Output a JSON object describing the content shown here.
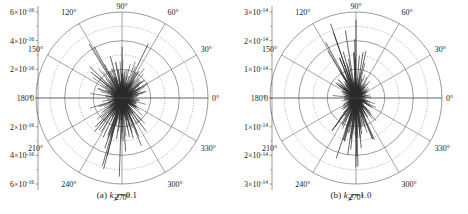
{
  "figure": {
    "panels": [
      {
        "id": "a",
        "caption_prefix": "(a) ",
        "caption_symbol": "k",
        "caption_sub": "3",
        "caption_var": "r",
        "caption_value": "=0.1",
        "caption_full": "(a) k3r=0.1"
      },
      {
        "id": "b",
        "caption_prefix": "(b) ",
        "caption_symbol": "k",
        "caption_sub": "3",
        "caption_var": "r",
        "caption_value": "=1.0",
        "caption_full": "(b) k3r=1.0"
      }
    ]
  },
  "chart_data": [
    {
      "type": "line",
      "plot_style": "polar-spike",
      "title": "(a) k3r=0.1",
      "xlabel": "",
      "ylabel": "",
      "grid": true,
      "legend": null,
      "angle_unit": "degrees",
      "angle_ticks": [
        "0°",
        "30°",
        "60°",
        "90°",
        "120°",
        "150°",
        "180°",
        "210°",
        "240°",
        "270°",
        "300°",
        "330°"
      ],
      "radial_axis": {
        "labels_top_to_bottom": [
          "6×10-16",
          "4×10-16",
          "2×10-16",
          "0",
          "2×10-16",
          "4×10-16",
          "6×10-16"
        ],
        "mantissas": [
          6,
          4,
          2,
          0,
          2,
          4,
          6
        ],
        "exponent": "-16",
        "rmax": 6e-16,
        "solid_rings": [
          2e-16,
          4e-16,
          6e-16
        ],
        "dotted_rings": [
          1e-16,
          3e-16,
          5e-16
        ]
      },
      "series": [
        {
          "name": "scattering amplitude",
          "theta_deg": [
            0,
            4,
            7,
            11,
            15,
            19,
            23,
            26,
            30,
            34,
            38,
            41,
            45,
            49,
            53,
            56,
            60,
            64,
            68,
            71,
            75,
            79,
            83,
            86,
            90,
            94,
            98,
            101,
            105,
            109,
            113,
            116,
            120,
            124,
            128,
            131,
            135,
            139,
            143,
            146,
            150,
            154,
            158,
            161,
            165,
            169,
            173,
            176,
            180,
            184,
            188,
            191,
            195,
            199,
            203,
            206,
            210,
            214,
            218,
            221,
            225,
            229,
            233,
            236,
            240,
            244,
            248,
            251,
            255,
            259,
            263,
            266,
            270,
            274,
            278,
            281,
            285,
            289,
            293,
            296,
            300,
            304,
            308,
            311,
            315,
            319,
            323,
            326,
            330,
            334,
            338,
            341,
            345,
            349,
            353,
            356
          ],
          "values": [
            0.9,
            1.4,
            0.7,
            1.9,
            1.1,
            2.2,
            0.8,
            1.5,
            2.6,
            1.0,
            1.7,
            0.9,
            2.1,
            1.3,
            2.8,
            1.2,
            1.8,
            3.0,
            1.5,
            2.4,
            1.1,
            3.4,
            1.9,
            2.7,
            4.4,
            2.0,
            3.1,
            1.6,
            2.9,
            3.8,
            1.8,
            2.3,
            3.3,
            1.4,
            2.0,
            0.9,
            1.6,
            2.5,
            1.2,
            1.8,
            1.0,
            2.1,
            1.3,
            0.8,
            1.5,
            0.9,
            1.7,
            1.1,
            0.6,
            1.2,
            0.8,
            1.4,
            1.0,
            1.9,
            1.3,
            0.9,
            1.6,
            1.1,
            2.0,
            1.4,
            2.3,
            1.6,
            2.9,
            1.8,
            2.4,
            3.5,
            2.0,
            3.0,
            4.1,
            2.6,
            3.3,
            2.1,
            4.6,
            2.8,
            3.9,
            2.2,
            3.1,
            1.9,
            2.7,
            1.5,
            2.2,
            1.3,
            2.6,
            1.7,
            1.1,
            2.0,
            1.4,
            0.9,
            1.6,
            1.2,
            2.1,
            1.0,
            1.5,
            0.8,
            1.3,
            1.1
          ],
          "value_scale": 1e-16
        }
      ]
    },
    {
      "type": "line",
      "plot_style": "polar-spike",
      "title": "(b) k3r=1.0",
      "xlabel": "",
      "ylabel": "",
      "grid": true,
      "legend": null,
      "angle_unit": "degrees",
      "angle_ticks": [
        "0°",
        "30°",
        "60°",
        "90°",
        "120°",
        "150°",
        "180°",
        "210°",
        "240°",
        "270°",
        "300°",
        "330°"
      ],
      "radial_axis": {
        "labels_top_to_bottom": [
          "3×10-14",
          "2×10-14",
          "1×10-14",
          "0",
          "1×10-14",
          "2×10-14",
          "3×10-14"
        ],
        "mantissas": [
          3,
          2,
          1,
          0,
          1,
          2,
          3
        ],
        "exponent": "-14",
        "rmax": 3e-14,
        "solid_rings": [
          1e-14,
          2e-14,
          3e-14
        ],
        "dotted_rings": [
          5e-15,
          1.5e-14,
          2.5e-14
        ]
      },
      "series": [
        {
          "name": "scattering amplitude",
          "theta_deg": [
            0,
            4,
            7,
            11,
            15,
            19,
            23,
            26,
            30,
            34,
            38,
            41,
            45,
            49,
            53,
            56,
            60,
            64,
            68,
            71,
            75,
            79,
            83,
            86,
            90,
            94,
            98,
            101,
            105,
            109,
            113,
            116,
            120,
            124,
            128,
            131,
            135,
            139,
            143,
            146,
            150,
            154,
            158,
            161,
            165,
            169,
            173,
            176,
            180,
            184,
            188,
            191,
            195,
            199,
            203,
            206,
            210,
            214,
            218,
            221,
            225,
            229,
            233,
            236,
            240,
            244,
            248,
            251,
            255,
            259,
            263,
            266,
            270,
            274,
            278,
            281,
            285,
            289,
            293,
            296,
            300,
            304,
            308,
            311,
            315,
            319,
            323,
            326,
            330,
            334,
            338,
            341,
            345,
            349,
            353,
            356
          ],
          "values": [
            0.25,
            0.35,
            0.2,
            0.45,
            0.3,
            0.5,
            0.25,
            0.4,
            0.55,
            0.3,
            0.6,
            0.35,
            0.7,
            0.45,
            0.9,
            0.5,
            0.8,
            1.2,
            0.6,
            1.0,
            0.55,
            1.6,
            0.9,
            1.4,
            2.6,
            1.0,
            1.8,
            0.8,
            1.5,
            2.2,
            0.9,
            1.3,
            1.9,
            0.7,
            1.1,
            0.5,
            0.9,
            1.4,
            0.6,
            0.8,
            0.4,
            0.7,
            0.45,
            0.3,
            0.5,
            0.3,
            0.55,
            0.35,
            0.2,
            0.35,
            0.25,
            0.45,
            0.3,
            0.6,
            0.4,
            0.3,
            0.5,
            0.35,
            0.7,
            0.45,
            0.8,
            0.55,
            1.1,
            0.7,
            1.0,
            1.6,
            0.8,
            1.4,
            2.0,
            1.1,
            1.7,
            0.9,
            2.4,
            1.3,
            1.9,
            1.0,
            1.5,
            0.8,
            1.3,
            0.6,
            1.0,
            0.5,
            1.2,
            0.7,
            0.4,
            0.8,
            0.5,
            0.3,
            0.6,
            0.4,
            0.7,
            0.35,
            0.5,
            0.25,
            0.4,
            0.3
          ],
          "value_scale": 1e-14
        }
      ]
    }
  ]
}
